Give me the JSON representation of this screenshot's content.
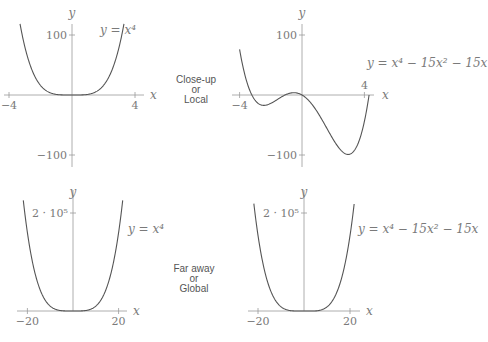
{
  "labels": {
    "close": [
      "Close-up",
      "or",
      "Local"
    ],
    "far": [
      "Far away",
      "or",
      "Global"
    ]
  },
  "chart_data": [
    {
      "type": "line",
      "id": "top-left",
      "function": "x^4",
      "equation_label": "y = x⁴",
      "xlabel": "x",
      "ylabel": "y",
      "xlim": [
        -4.5,
        4.5
      ],
      "ylim": [
        -115,
        120
      ],
      "xticks": [
        {
          "v": -4,
          "label": "−4"
        },
        {
          "v": 4,
          "label": "4"
        }
      ],
      "yticks": [
        {
          "v": 100,
          "label": "100"
        },
        {
          "v": -100,
          "label": "−100"
        }
      ],
      "curve_domain": [
        -3.3,
        3.3
      ]
    },
    {
      "type": "line",
      "id": "top-right",
      "function": "x^4 - 15x^2 - 15x",
      "equation_label": "y = x⁴ − 15x² − 15x",
      "xlabel": "x",
      "ylabel": "y",
      "xlim": [
        -4.5,
        4.5
      ],
      "ylim": [
        -115,
        120
      ],
      "xticks": [
        {
          "v": -4,
          "label": "−4"
        },
        {
          "v": 4,
          "label": "4"
        }
      ],
      "yticks": [
        {
          "v": 100,
          "label": "100"
        },
        {
          "v": -100,
          "label": "−100"
        }
      ],
      "curve_domain": [
        -4.0,
        4.3
      ]
    },
    {
      "type": "line",
      "id": "bottom-left",
      "function": "x^4",
      "equation_label": "y = x⁴",
      "xlabel": "x",
      "ylabel": "y",
      "xlim": [
        -22,
        22
      ],
      "ylim": [
        0,
        230000
      ],
      "xticks": [
        {
          "v": -20,
          "label": "−20"
        },
        {
          "v": 20,
          "label": "20"
        }
      ],
      "yticks": [
        {
          "v": 200000,
          "label": "2 · 10⁵"
        }
      ],
      "curve_domain": [
        -21.8,
        21.8
      ]
    },
    {
      "type": "line",
      "id": "bottom-right",
      "function": "x^4 - 15x^2 - 15x",
      "equation_label": "y = x⁴ − 15x² − 15x",
      "xlabel": "x",
      "ylabel": "y",
      "xlim": [
        -22,
        22
      ],
      "ylim": [
        0,
        230000
      ],
      "xticks": [
        {
          "v": -20,
          "label": "−20"
        },
        {
          "v": 20,
          "label": "20"
        }
      ],
      "yticks": [
        {
          "v": 200000,
          "label": "2 · 10⁵"
        }
      ],
      "curve_domain": [
        -21.8,
        21.8
      ]
    }
  ]
}
